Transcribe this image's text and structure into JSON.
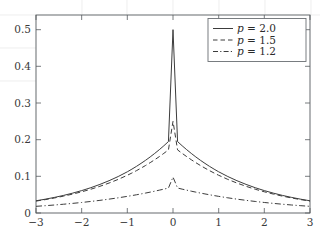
{
  "chart_data": {
    "type": "line",
    "title": "",
    "subtitle": "",
    "xlabel": "",
    "ylabel": "",
    "xlim": [
      -3,
      3
    ],
    "ylim": [
      0,
      0.54
    ],
    "grid": false,
    "legend_position": "top-right",
    "xticks": [
      -3,
      -2,
      -1,
      0,
      1,
      2,
      3
    ],
    "xticklabels": [
      "−3",
      "−2",
      "−1",
      "0",
      "1",
      "2",
      "3"
    ],
    "yticks": [
      0,
      0.1,
      0.2,
      0.3,
      0.4,
      0.5
    ],
    "yticklabels": [
      "0",
      "0.1",
      "0.2",
      "0.3",
      "0.4",
      "0.5"
    ],
    "x": [
      -3,
      -2.8,
      -2.6,
      -2.4,
      -2.2,
      -2,
      -1.8,
      -1.6,
      -1.4,
      -1.2,
      -1,
      -0.9,
      -0.8,
      -0.7,
      -0.6,
      -0.5,
      -0.4,
      -0.3,
      -0.2,
      -0.1,
      0,
      0.1,
      0.2,
      0.3,
      0.4,
      0.5,
      0.6,
      0.7,
      0.8,
      0.9,
      1,
      1.2,
      1.4,
      1.6,
      1.8,
      2,
      2.2,
      2.4,
      2.6,
      2.8,
      3
    ],
    "series": [
      {
        "name": "p = 2.0",
        "legend_label": "p = 2.0",
        "symbol": "p",
        "param": "2.0",
        "linestyle": "solid",
        "color": "#3c3c3c",
        "peak": 0.5,
        "values": [
          0.0333,
          0.0376,
          0.0424,
          0.0479,
          0.0541,
          0.0611,
          0.069,
          0.078,
          0.0881,
          0.0995,
          0.1124,
          0.1196,
          0.1272,
          0.1353,
          0.1438,
          0.1529,
          0.1625,
          0.1727,
          0.1834,
          0.1948,
          0.5,
          0.1948,
          0.1834,
          0.1727,
          0.1625,
          0.1529,
          0.1438,
          0.1353,
          0.1272,
          0.1196,
          0.1124,
          0.0995,
          0.0881,
          0.078,
          0.069,
          0.0611,
          0.0541,
          0.0479,
          0.0424,
          0.0376,
          0.0333
        ]
      },
      {
        "name": "p = 1.5",
        "legend_label": "p = 1.5",
        "symbol": "p",
        "param": "1.5",
        "linestyle": "dashed",
        "color": "#3c3c3c",
        "peak": 0.25,
        "values": [
          0.0325,
          0.0364,
          0.0409,
          0.0459,
          0.0515,
          0.0578,
          0.0648,
          0.0728,
          0.0817,
          0.0917,
          0.1029,
          0.109,
          0.1155,
          0.1224,
          0.1296,
          0.1373,
          0.1453,
          0.1538,
          0.1627,
          0.1721,
          0.25,
          0.1721,
          0.1627,
          0.1538,
          0.1453,
          0.1373,
          0.1296,
          0.1224,
          0.1155,
          0.109,
          0.1029,
          0.0917,
          0.0817,
          0.0728,
          0.0648,
          0.0578,
          0.0515,
          0.0459,
          0.0409,
          0.0364,
          0.0325
        ]
      },
      {
        "name": "p = 1.2",
        "legend_label": "p = 1.2",
        "symbol": "p",
        "param": "1.2",
        "linestyle": "dashdot",
        "color": "#3c3c3c",
        "peak": 0.098,
        "values": [
          0.0182,
          0.0199,
          0.0218,
          0.0239,
          0.0262,
          0.0287,
          0.0315,
          0.0345,
          0.0378,
          0.0414,
          0.0454,
          0.0475,
          0.0497,
          0.052,
          0.0544,
          0.0569,
          0.0595,
          0.0623,
          0.0651,
          0.0681,
          0.098,
          0.0681,
          0.0651,
          0.0623,
          0.0595,
          0.0569,
          0.0544,
          0.052,
          0.0497,
          0.0475,
          0.0454,
          0.0414,
          0.0378,
          0.0345,
          0.0315,
          0.0287,
          0.0262,
          0.0239,
          0.0218,
          0.0199,
          0.0182
        ]
      }
    ]
  },
  "legend": {
    "entries": [
      {
        "label": "p = 2.0",
        "style": "solid"
      },
      {
        "label": "p = 1.5",
        "style": "dashed"
      },
      {
        "label": "p = 1.2",
        "style": "dashdot"
      }
    ]
  },
  "axes": {
    "x_tick_labels": [
      "−3",
      "−2",
      "−1",
      "0",
      "1",
      "2",
      "3"
    ],
    "y_tick_labels": [
      "0",
      "0.1",
      "0.2",
      "0.3",
      "0.4",
      "0.5"
    ]
  },
  "colors": {
    "curve": "#3c3c3c",
    "axis": "#555a5e",
    "text": "#3a3a3a",
    "legend_border": "#6a6f73",
    "background": "#ffffff",
    "outer_grid": "#e6e6e6"
  }
}
